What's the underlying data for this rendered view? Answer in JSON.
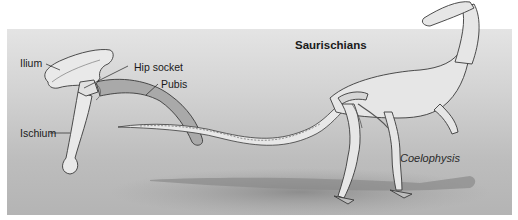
{
  "figure": {
    "group_title": "Saurischians",
    "species_label": "Coelophysis",
    "pelvis_labels": {
      "ilium": "Ilium",
      "hip_socket": "Hip socket",
      "pubis": "Pubis",
      "ischium": "Ischium"
    }
  },
  "colors": {
    "panel_top": "#e4e4e4",
    "panel_bottom": "#b4b4b4",
    "bone_fill": "#e9e9e9",
    "pubis_fill": "#a9a9a9",
    "outline": "#3a3a3a",
    "shadow": "#8f8f8f"
  }
}
